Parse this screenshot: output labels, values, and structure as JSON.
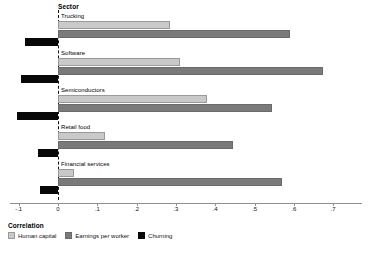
{
  "chart_data": {
    "type": "bar",
    "orientation": "horizontal",
    "title": "",
    "group_axis_title": "Sector",
    "xlabel": "Correlation",
    "ylabel": "Sector",
    "categories": [
      "Trucking",
      "Software",
      "Semiconductors",
      "Retail food",
      "Financial services"
    ],
    "series": [
      {
        "name": "Human capital",
        "color": "#c9c9c9",
        "values": [
          0.285,
          0.31,
          0.38,
          0.12,
          0.04
        ]
      },
      {
        "name": "Earnings per worker",
        "color": "#7a7a7a",
        "values": [
          0.59,
          0.675,
          0.545,
          0.445,
          0.57
        ]
      },
      {
        "name": "Churning",
        "color": "#080808",
        "values": [
          -0.085,
          -0.095,
          -0.105,
          -0.05,
          -0.045
        ]
      }
    ],
    "xlim": [
      -0.13,
      0.76
    ],
    "xticks": [
      -0.1,
      0,
      0.1,
      0.2,
      0.3,
      0.4,
      0.5,
      0.6,
      0.7
    ],
    "xticklabels": [
      "-.1",
      "0",
      ".1",
      ".2",
      ".3",
      ".4",
      ".5",
      ".6",
      ".7"
    ],
    "grid": false,
    "zero_reference_line": true,
    "legend": {
      "title": "Correlation",
      "position": "bottom-left",
      "entries": [
        "Human capital",
        "Earnings per worker",
        "Churning"
      ]
    }
  }
}
